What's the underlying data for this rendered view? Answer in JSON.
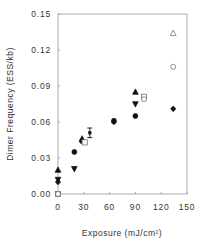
{
  "chart_data": {
    "type": "scatter",
    "title": "",
    "xlabel": "Exposure  (mJ/cm²)",
    "ylabel": "Dimer  Frequency  (ESS/kb)",
    "xlim": [
      0,
      150
    ],
    "ylim": [
      0,
      0.15
    ],
    "xticks": [
      0,
      30,
      60,
      90,
      120,
      150
    ],
    "xtick_labels": [
      "0",
      "30",
      "60",
      "90",
      "120",
      "150"
    ],
    "yticks": [
      0,
      0.03,
      0.06,
      0.09,
      0.12,
      0.15
    ],
    "ytick_labels": [
      "0.00",
      "0.03",
      "0.06",
      "0.09",
      "0.12",
      "0.15"
    ],
    "grid": false,
    "legend": null,
    "series": [
      {
        "name": "filled-triangle-up",
        "marker": "triangle-up",
        "filled": true,
        "points": [
          [
            0,
            0.02
          ],
          [
            28,
            0.046
          ],
          [
            90,
            0.085
          ]
        ]
      },
      {
        "name": "filled-triangle-down",
        "marker": "triangle-down",
        "filled": true,
        "points": [
          [
            0,
            0.012
          ],
          [
            19,
            0.021
          ],
          [
            90,
            0.075
          ]
        ]
      },
      {
        "name": "filled-circle",
        "marker": "circle",
        "filled": true,
        "points": [
          [
            0,
            0.0
          ],
          [
            19,
            0.035
          ],
          [
            28,
            0.044
          ],
          [
            65,
            0.061
          ],
          [
            90,
            0.065
          ]
        ]
      },
      {
        "name": "filled-diamond",
        "marker": "diamond",
        "filled": true,
        "points": [
          [
            0,
            0.01
          ],
          [
            65,
            0.06
          ],
          [
            134,
            0.071
          ]
        ]
      },
      {
        "name": "open-square",
        "marker": "square",
        "filled": false,
        "points": [
          [
            0,
            0.0
          ],
          [
            31,
            0.043
          ],
          [
            100,
            0.081
          ]
        ]
      },
      {
        "name": "open-circle",
        "marker": "circle",
        "filled": false,
        "points": [
          [
            0,
            0.0
          ],
          [
            100,
            0.079
          ],
          [
            134,
            0.106
          ]
        ]
      },
      {
        "name": "open-triangle-up",
        "marker": "triangle-up",
        "filled": false,
        "points": [
          [
            134,
            0.134
          ]
        ]
      },
      {
        "name": "error-bar-mean",
        "marker": "errorbar",
        "filled": true,
        "points": [
          [
            37,
            0.051
          ]
        ],
        "error": [
          0.004
        ]
      }
    ]
  }
}
